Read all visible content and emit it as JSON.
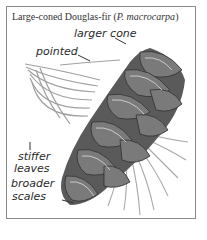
{
  "figure": {
    "title_prefix": "Large-coned Douglas-fir (",
    "title_species": "P. macrocarpa",
    "title_suffix": ")",
    "labels": {
      "larger_cone": "larger cone",
      "pointed": "pointed",
      "stiffer": "stiffer",
      "leaves": "leaves",
      "broader": "broader",
      "scales": "scales"
    },
    "colors": {
      "frame": "#8a8a8a",
      "text": "#2a2a2a",
      "cone_dark": "#3a3a3a",
      "cone_mid": "#6e6e6e",
      "needles": "#9a9a9a"
    }
  }
}
